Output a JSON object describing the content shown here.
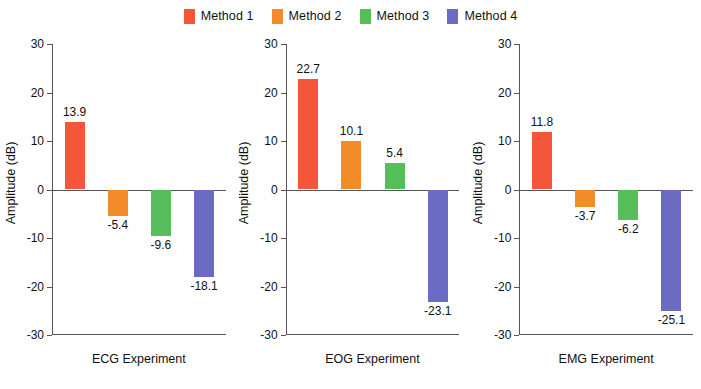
{
  "legend": {
    "entries": [
      {
        "label": "Method 1",
        "color": "#F4563C"
      },
      {
        "label": "Method 2",
        "color": "#F28C28"
      },
      {
        "label": "Method 3",
        "color": "#57BE5C"
      },
      {
        "label": "Method 4",
        "color": "#6B6BC4"
      }
    ]
  },
  "axis": {
    "ylabel": "Amplitude (dB)",
    "ticks": [
      "30",
      "20",
      "10",
      "0",
      "-10",
      "-20",
      "-30"
    ]
  },
  "panels": [
    {
      "xlabel": "ECG Experiment",
      "values": [
        "13.9",
        "-5.4",
        "-9.6",
        "-18.1"
      ]
    },
    {
      "xlabel": "EOG Experiment",
      "values": [
        "22.7",
        "10.1",
        "5.4",
        "-23.1"
      ]
    },
    {
      "xlabel": "EMG Experiment",
      "values": [
        "11.8",
        "-3.7",
        "-6.2",
        "-25.1"
      ]
    }
  ],
  "chart_data": {
    "type": "bar",
    "title": "",
    "xlabel": "",
    "ylabel": "Amplitude (dB)",
    "ylim": [
      -30,
      30
    ],
    "ytick_values": [
      30,
      20,
      10,
      0,
      -10,
      -20,
      -30
    ],
    "grid": false,
    "legend_position": "top-center",
    "categories": [
      "ECG Experiment",
      "EOG Experiment",
      "EMG Experiment"
    ],
    "series": [
      {
        "name": "Method 1",
        "color": "#F4563C",
        "values": [
          13.9,
          22.7,
          11.8
        ]
      },
      {
        "name": "Method 2",
        "color": "#F28C28",
        "values": [
          -5.4,
          10.1,
          -3.7
        ]
      },
      {
        "name": "Method 3",
        "color": "#57BE5C",
        "values": [
          -9.6,
          5.4,
          -6.2
        ]
      },
      {
        "name": "Method 4",
        "color": "#6B6BC4",
        "values": [
          -18.1,
          -23.1,
          -25.1
        ]
      }
    ]
  }
}
